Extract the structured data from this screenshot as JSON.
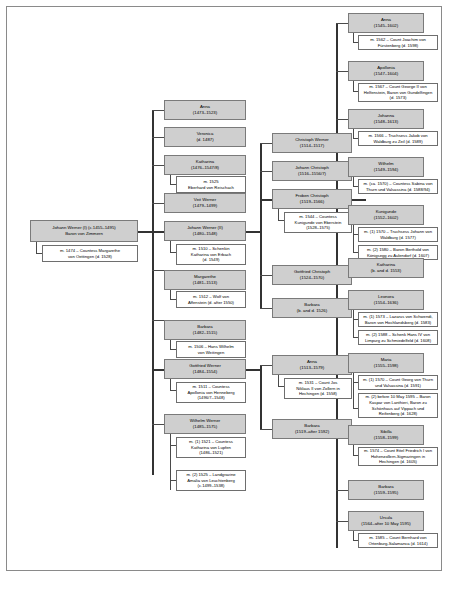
{
  "diagram": {
    "type": "genealogical-family-tree",
    "colors": {
      "node_fill": "#cfcfcf",
      "node_border": "#7a7a7a",
      "marriage_fill": "#ffffff",
      "marriage_border": "#6e6e6e",
      "connector": "#4a4a4a",
      "frame_border": "#8a8a8a",
      "background": "#ffffff"
    },
    "generations": [
      {
        "index": 1,
        "label": "root",
        "people": [
          {
            "id": "johann-werner-i",
            "name": "Johann Werner (I) (c.1455–1495)",
            "dates": "Baron von Zimmern",
            "marriages": [
              {
                "text_lines": [
                  "m. 1474 – Countess Margarethe",
                  "von Oettingen (d. 1528)"
                ]
              }
            ]
          }
        ]
      },
      {
        "index": 2,
        "label": "children-of-johann-werner-i",
        "people": [
          {
            "id": "anna-1473",
            "name": "Anna",
            "dates": "(1473–1523)",
            "marriages": []
          },
          {
            "id": "veronica",
            "name": "Veronica",
            "dates": "(d. 1487)",
            "marriages": []
          },
          {
            "id": "katharina-1476",
            "name": "Katharina",
            "dates": "(1476–1547/8)",
            "marriages": [
              {
                "text_lines": [
                  "m. 1525",
                  "Eberhard von Reischach"
                ]
              }
            ]
          },
          {
            "id": "veit-werner",
            "name": "Veit Werner",
            "dates": "(1479–1499)",
            "marriages": []
          },
          {
            "id": "johann-werner-ii",
            "name": "Johann Werner (II)",
            "dates": "(1480–1548)",
            "marriages": [
              {
                "text_lines": [
                  "m. 1510 – Schenkin",
                  "Katharina von Erbach",
                  "(d. 1549)"
                ]
              }
            ]
          },
          {
            "id": "margarethe-1481",
            "name": "Margarethe",
            "dates": "(1481–1513)",
            "marriages": [
              {
                "text_lines": [
                  "m. 1512 – Wolf von",
                  "Affenstein (d. after 1550)"
                ]
              }
            ]
          },
          {
            "id": "barbara-1482",
            "name": "Barbara",
            "dates": "(1482–1515)",
            "marriages": [
              {
                "text_lines": [
                  "m. 1506 – Hans Wilhelm",
                  "von Weitingen"
                ]
              }
            ]
          },
          {
            "id": "gottfried-werner",
            "name": "Gottfried Werner",
            "dates": "(1484–1554)",
            "marriages": [
              {
                "text_lines": [
                  "m. 1511 – Countess",
                  "Apollonia von Henneberg",
                  "(1496/7–1548)"
                ]
              }
            ]
          },
          {
            "id": "wilhelm-werner",
            "name": "Wilhelm Werner",
            "dates": "(1485–1575)",
            "marriages": [
              {
                "text_lines": [
                  "m. (1) 1521 – Countess",
                  "Katharina von Lupfen",
                  "(1486–1521)"
                ]
              },
              {
                "text_lines": [
                  "m. (2) 1525 – Landgravine",
                  "Amalia von Leuchtenberg",
                  "(c.1499–1538)"
                ]
              }
            ]
          }
        ]
      },
      {
        "index": 3,
        "label": "grandchildren",
        "people": [
          {
            "id": "christoph-werner",
            "name": "Christoph Werner",
            "dates": "(1514–1517)",
            "marriages": []
          },
          {
            "id": "johann-christoph",
            "name": "Johann Christoph",
            "dates": "(1516–1556/7)",
            "marriages": []
          },
          {
            "id": "froben-christoph",
            "name": "Froben Christoph",
            "dates": "(1519–1566)",
            "marriages": [
              {
                "text_lines": [
                  "m. 1544 – Countess",
                  "Kunigunde von Eberstein",
                  "(1528–1575)"
                ]
              }
            ]
          },
          {
            "id": "gottfried-christoph",
            "name": "Gottfried Christoph",
            "dates": "(1524–1570)",
            "marriages": []
          },
          {
            "id": "barbara-1526",
            "name": "Barbara",
            "dates": "(b. and d. 1526)",
            "marriages": []
          },
          {
            "id": "anna-1513",
            "name": "Anna",
            "dates": "(1513–1579)",
            "marriages": [
              {
                "text_lines": [
                  "m. 1531 – Count Jos",
                  "Niklaus II von Zollern in",
                  "Hechingen (d. 1558)"
                ]
              }
            ]
          },
          {
            "id": "barbara-1519",
            "name": "Barbara",
            "dates": "(1519–after 1592)",
            "marriages": []
          }
        ]
      },
      {
        "index": 4,
        "label": "great-grandchildren",
        "people": [
          {
            "id": "anna-1545",
            "name": "Anna",
            "dates": "(1545–1602)",
            "marriages": [
              {
                "text_lines": [
                  "m. 1562 – Count Joachim von",
                  "Fürstenberg (d. 1598)"
                ]
              }
            ]
          },
          {
            "id": "apollonia-1547",
            "name": "Apollonia",
            "dates": "(1547–1604)",
            "marriages": [
              {
                "text_lines": [
                  "m. 1567 – Count George II von",
                  "Helfenstein, Baron von Gundelfingen",
                  "(d. 1573)"
                ]
              }
            ]
          },
          {
            "id": "johanna-1548",
            "name": "Johanna",
            "dates": "(1548–1613)",
            "marriages": [
              {
                "text_lines": [
                  "m. 1566 – Truchsess Jakob von",
                  "Waldburg zu Zeil (d. 1589)"
                ]
              }
            ]
          },
          {
            "id": "wilhelm-1549",
            "name": "Wilhelm",
            "dates": "(1549–1594)",
            "marriages": [
              {
                "text_lines": [
                  "m. (ca. 1570) – Countess Sabina von",
                  "Thurn und Valsassina (d. 1588/94)"
                ]
              }
            ]
          },
          {
            "id": "kunigunde-1552",
            "name": "Kunigunde",
            "dates": "(1552–1602)",
            "marriages": [
              {
                "text_lines": [
                  "m. (1) 1570 – Truchsess Johann von",
                  "Waldburg (d. 1577)"
                ]
              },
              {
                "text_lines": [
                  "m. (2) 1580 – Baron Berthold von",
                  "Königsegg zu Aulendorf (d. 1607)"
                ]
              }
            ]
          },
          {
            "id": "katharina-1553",
            "name": "Katharina",
            "dates": "(b. and d. 1553)",
            "marriages": []
          },
          {
            "id": "leonora-1554",
            "name": "Leonora",
            "dates": "(1554–1636)",
            "marriages": [
              {
                "text_lines": [
                  "m. (1) 1573 – Lazarus von Schwendi,",
                  "Baron von Hochlandsberg (d. 1583)"
                ]
              },
              {
                "text_lines": [
                  "m. (2) 1588 – Schenk Hans IV von",
                  "Limpurg zu Schmiedelfeld (d. 1608)"
                ]
              }
            ]
          },
          {
            "id": "maria-1555",
            "name": "Maria",
            "dates": "(1555–1598)",
            "marriages": [
              {
                "text_lines": [
                  "m. (1) 1570 – Count Georg von Thurn",
                  "und Valsassina (d. 1591)"
                ]
              },
              {
                "text_lines": [
                  "m. (2) before 10 May 1595 – Baron",
                  "Kaspar von Lanthieri, Baron zu",
                  "Schönhaus auf Vippach und",
                  "Reifenberg (d. 1628)"
                ]
              }
            ]
          },
          {
            "id": "sibilla-1558",
            "name": "Sibilla",
            "dates": "(1558–1599)",
            "marriages": [
              {
                "text_lines": [
                  "m. 1574 – Count Eitel Friedrich I von",
                  "Hohenzollern-Sigmaringen in",
                  "Hechingen (d. 1605)"
                ]
              }
            ]
          },
          {
            "id": "barbara-1559",
            "name": "Barbara",
            "dates": "(1559–1595)",
            "marriages": []
          },
          {
            "id": "ursula-1564",
            "name": "Ursula",
            "dates": "(1564–after 10 May 1595)",
            "marriages": [
              {
                "text_lines": [
                  "m. 1585 – Count Bernhard von",
                  "Ortenburg-Salamanca (d. 1614)"
                ]
              }
            ]
          }
        ]
      }
    ]
  }
}
